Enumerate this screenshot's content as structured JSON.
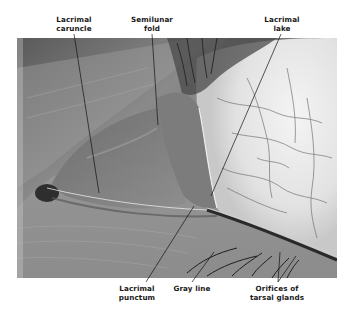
{
  "figure": {
    "type": "anatomical photograph",
    "colors": {
      "background": "#ffffff",
      "label_text": "#1a1a1a",
      "leader_line": "#111111"
    }
  },
  "labels": {
    "lacrimal_caruncle": {
      "line1": "Lacrimal",
      "line2": "caruncle"
    },
    "semilunar_fold": {
      "line1": "Semilunar",
      "line2": "fold"
    },
    "lacrimal_lake": {
      "line1": "Lacrimal",
      "line2": "lake"
    },
    "lacrimal_punctum": {
      "line1": "Lacrimal",
      "line2": "punctum"
    },
    "gray_line": {
      "line1": "Gray line"
    },
    "orifices_tarsal_glands": {
      "line1": "Orifices of",
      "line2": "tarsal glands"
    }
  }
}
